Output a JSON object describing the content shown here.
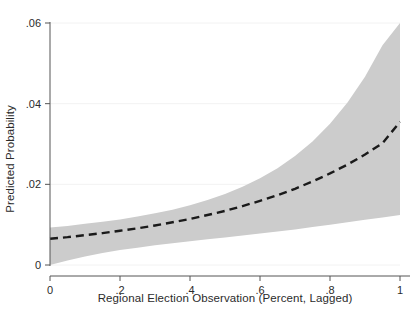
{
  "chart_data": {
    "type": "line",
    "title": "",
    "xlabel": "Regional Election Observation (Percent, Lagged)",
    "ylabel": "Predicted Probability",
    "xlim": [
      0,
      1
    ],
    "ylim": [
      0,
      0.06
    ],
    "grid": true,
    "grid_axis": "y",
    "legend": "none",
    "x_ticks": [
      0,
      0.2,
      0.4,
      0.6,
      0.8,
      1
    ],
    "x_tick_labels": [
      "0",
      ".2",
      ".4",
      ".6",
      ".8",
      "1"
    ],
    "y_ticks": [
      0,
      0.02,
      0.04,
      0.06
    ],
    "y_tick_labels": [
      "0",
      ".02",
      ".04",
      ".06"
    ],
    "series": [
      {
        "name": "Predicted Probability",
        "style": "dashed",
        "color": "#1a1a1a",
        "x": [
          0,
          0.05,
          0.1,
          0.15,
          0.2,
          0.25,
          0.3,
          0.35,
          0.4,
          0.45,
          0.5,
          0.55,
          0.6,
          0.65,
          0.7,
          0.75,
          0.8,
          0.85,
          0.9,
          0.95,
          1
        ],
        "values": [
          0.0065,
          0.0069,
          0.0074,
          0.0079,
          0.0085,
          0.0091,
          0.0098,
          0.0106,
          0.0114,
          0.0124,
          0.0134,
          0.0146,
          0.0159,
          0.0173,
          0.0189,
          0.0207,
          0.0227,
          0.0249,
          0.0274,
          0.0302,
          0.0355
        ]
      },
      {
        "name": "Confidence interval upper bound",
        "style": "band-edge",
        "color": "#cccccc",
        "x": [
          0,
          0.05,
          0.1,
          0.15,
          0.2,
          0.25,
          0.3,
          0.35,
          0.4,
          0.45,
          0.5,
          0.55,
          0.6,
          0.65,
          0.7,
          0.75,
          0.8,
          0.85,
          0.9,
          0.95,
          1
        ],
        "values": [
          0.0093,
          0.0097,
          0.0102,
          0.0107,
          0.0113,
          0.012,
          0.0128,
          0.0137,
          0.0148,
          0.0161,
          0.0176,
          0.0194,
          0.0215,
          0.024,
          0.027,
          0.0306,
          0.035,
          0.0403,
          0.0467,
          0.0545,
          0.06
        ]
      },
      {
        "name": "Confidence interval lower bound",
        "style": "band-edge",
        "color": "#cccccc",
        "x": [
          0,
          0.05,
          0.1,
          0.15,
          0.2,
          0.25,
          0.3,
          0.35,
          0.4,
          0.45,
          0.5,
          0.55,
          0.6,
          0.65,
          0.7,
          0.75,
          0.8,
          0.85,
          0.9,
          0.95,
          1
        ],
        "values": [
          0.0,
          0.0011,
          0.0021,
          0.003,
          0.0037,
          0.0043,
          0.0049,
          0.0054,
          0.0059,
          0.0064,
          0.0068,
          0.0073,
          0.0078,
          0.0083,
          0.0088,
          0.0094,
          0.01,
          0.0106,
          0.0112,
          0.0118,
          0.0124
        ]
      }
    ],
    "band": {
      "name": "95% confidence interval",
      "fill_color": "#cccccc"
    },
    "colors": {
      "line": "#1a1a1a",
      "band": "#cccccc",
      "axis": "#555555",
      "grid": "#f2f2f2",
      "background": "#ffffff",
      "text": "#2b2b2b"
    }
  }
}
